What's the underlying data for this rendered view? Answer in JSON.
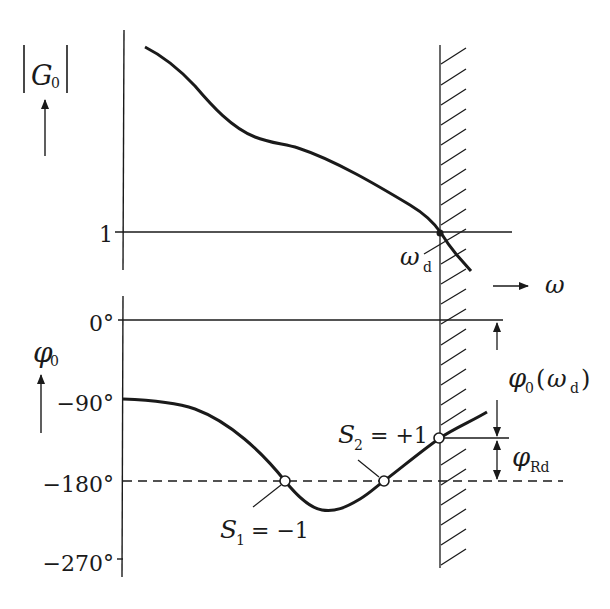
{
  "colors": {
    "ink": "#1a1a1a",
    "background": "#ffffff"
  },
  "magnitude_plot": {
    "ylabel_main": "G",
    "ylabel_sub": "0",
    "tick_one": "1",
    "crossover_label_main": "ω",
    "crossover_label_sub": "d",
    "xaxis_label": "ω"
  },
  "phase_plot": {
    "ylabel_main": "φ",
    "ylabel_sub": "0",
    "ticks": [
      "0°",
      "−90°",
      "−180°",
      "−270°"
    ],
    "s1_main": "S",
    "s1_sub": "1",
    "s1_value": " = −1",
    "s2_main": "S",
    "s2_sub": "2",
    "s2_value": " = +1",
    "phase_at_crossover_main": "φ",
    "phase_at_crossover_sub": "0",
    "phase_at_crossover_arg_main": "ω",
    "phase_at_crossover_arg_sub": "d",
    "phase_margin_main": "φ",
    "phase_margin_sub": "Rd"
  }
}
